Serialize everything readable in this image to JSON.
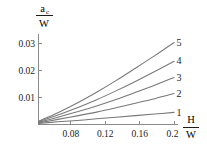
{
  "chart_data": {
    "type": "line",
    "title": "",
    "subtitle": "",
    "xlabel_numerator": "H",
    "xlabel_denominator": "W",
    "xlabel": "H/W",
    "ylabel_numerator": "a",
    "ylabel_numerator_subscript": "c",
    "ylabel_denominator": "W",
    "ylabel": "a_c/W",
    "grid": false,
    "legend_position": "inline-right-end-labels",
    "xlim": [
      0.06,
      0.205
    ],
    "ylim": [
      0.0,
      0.0325
    ],
    "xticks": [
      0.08,
      0.12,
      0.16,
      0.2
    ],
    "xticklabels": [
      "0.08",
      "0.12",
      "0.16",
      "0.2"
    ],
    "yticks": [
      0.01,
      0.02,
      0.03
    ],
    "yticklabels": [
      "0.01",
      "0.02",
      "0.03"
    ],
    "x": [
      0.06,
      0.08,
      0.1,
      0.12,
      0.14,
      0.16,
      0.18,
      0.2
    ],
    "series": [
      {
        "name": "1",
        "label": "1",
        "values": [
          0.0004,
          0.001,
          0.0015,
          0.0021,
          0.0027,
          0.0033,
          0.0039,
          0.0045
        ]
      },
      {
        "name": "2",
        "label": "2",
        "values": [
          0.0006,
          0.0019,
          0.0032,
          0.0046,
          0.0062,
          0.0079,
          0.0096,
          0.0115
        ]
      },
      {
        "name": "3",
        "label": "3",
        "values": [
          0.0008,
          0.0027,
          0.0047,
          0.0069,
          0.0093,
          0.0119,
          0.0146,
          0.0175
        ]
      },
      {
        "name": "4",
        "label": "4",
        "values": [
          0.001,
          0.0035,
          0.0062,
          0.0092,
          0.0125,
          0.016,
          0.0197,
          0.0235
        ]
      },
      {
        "name": "5",
        "label": "5",
        "values": [
          0.0012,
          0.0044,
          0.008,
          0.012,
          0.0163,
          0.0209,
          0.0256,
          0.0305
        ]
      }
    ]
  },
  "axes": {
    "y_axis_name": "y-axis",
    "x_axis_name": "x-axis"
  }
}
